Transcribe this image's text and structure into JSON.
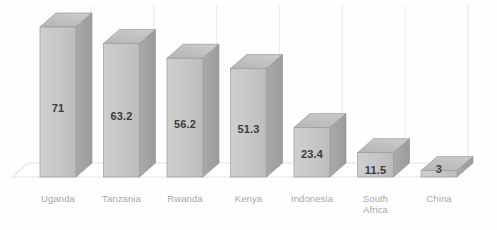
{
  "chart_data": {
    "type": "bar",
    "title": "",
    "subtitle": "",
    "xlabel": "",
    "ylabel": "",
    "categories": [
      "Uganda",
      "Tanzania",
      "Rwanda",
      "Kenya",
      "Indonesia",
      "South Africa",
      "China"
    ],
    "values": [
      71,
      63.2,
      56.2,
      51.3,
      23.4,
      11.5,
      3
    ],
    "value_labels": [
      "71",
      "63.2",
      "56.2",
      "51.3",
      "23.4",
      "11.5",
      "3"
    ],
    "category_label_lines": [
      [
        "Uganda"
      ],
      [
        "Tanzania"
      ],
      [
        "Rwanda"
      ],
      [
        "Kenya"
      ],
      [
        "Indonesia"
      ],
      [
        "South",
        "Africa"
      ],
      [
        "China"
      ]
    ],
    "ylim": [
      0,
      80
    ],
    "grid": true,
    "legend": "none",
    "style": "3d-column",
    "colors": {
      "bar_front": "#c6c6c6",
      "bar_top": "#bdbdbd",
      "bar_side": "#a2a2a2",
      "bar_edge": "#9a9a9a",
      "gridline": "#e6e6e6",
      "floor_line": "#e0e0e0",
      "value_text": "#3c3c3c",
      "category_text": "#a8a8a8",
      "background": "#fefefe"
    }
  }
}
